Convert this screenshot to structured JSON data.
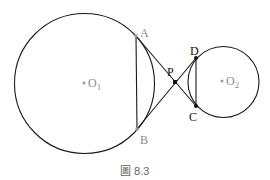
{
  "figure": {
    "caption": "圖 8.3",
    "colors": {
      "stroke": "#1a1a1a",
      "gray_point": "#9a9a9a",
      "gray_label": "#8c8c8c",
      "black_point": "#111111",
      "caption": "#666666"
    },
    "circles": [
      {
        "name": "O1",
        "label": "O",
        "subscript": "1",
        "cx": 84.5,
        "cy": 83.5,
        "r": 70
      },
      {
        "name": "O2",
        "label": "O",
        "subscript": "2",
        "cx": 223.5,
        "cy": 82,
        "r": 35.5
      }
    ],
    "points": {
      "A": {
        "label": "A",
        "x": 136,
        "y": 36
      },
      "B": {
        "label": "B",
        "x": 137,
        "y": 129
      },
      "P": {
        "label": "P",
        "x": 175,
        "y": 82
      },
      "D": {
        "label": "D",
        "x": 196,
        "y": 58
      },
      "C": {
        "label": "C",
        "x": 196,
        "y": 106
      }
    },
    "segments": [
      "AB",
      "AC",
      "BD",
      "DC"
    ]
  }
}
